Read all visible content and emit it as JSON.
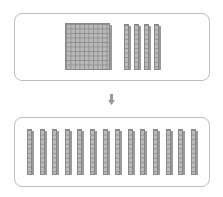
{
  "diagram": {
    "top_group": {
      "hundreds_flats": 1,
      "tens_rods": 4
    },
    "arrow": "down-arrow",
    "bottom_group": {
      "tens_rods": 14
    },
    "colors": {
      "block_fill": "#bcbcbc",
      "block_line": "#8f8f8f",
      "border": "#bdbdbd",
      "arrow": "#999999"
    }
  }
}
